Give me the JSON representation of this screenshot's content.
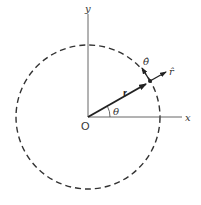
{
  "diagram": {
    "labels": {
      "y_axis": "y",
      "x_axis": "x",
      "origin": "O",
      "radius_vector": "r",
      "angle": "θ",
      "theta_hat": "θ̂",
      "r_hat": "r̂"
    },
    "colors": {
      "lines": "#333333",
      "background": "#ffffff"
    },
    "geometry": {
      "origin": [
        88,
        117
      ],
      "circle_radius": 72,
      "circle_style": "dashed",
      "point_on_circle": [
        150,
        81
      ]
    }
  }
}
